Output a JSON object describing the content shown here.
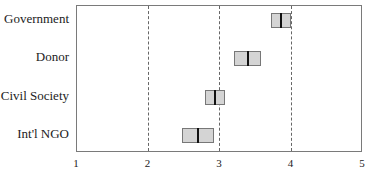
{
  "chart_data": {
    "type": "boxplot",
    "orientation": "horizontal",
    "title": "",
    "xlabel": "",
    "ylabel": "",
    "xlim": [
      1,
      5
    ],
    "x_ticks": [
      "1",
      "2",
      "3",
      "4",
      "5"
    ],
    "grid": {
      "vertical_dashed_at": [
        2,
        3,
        4
      ]
    },
    "categories": [
      "Government",
      "Donor",
      "Civil Society",
      "Int'l NGO"
    ],
    "series": [
      {
        "name": "Government",
        "q1": 3.72,
        "median": 3.86,
        "q3": 4.0
      },
      {
        "name": "Donor",
        "q1": 3.19,
        "median": 3.39,
        "q3": 3.58
      },
      {
        "name": "Civil Society",
        "q1": 2.79,
        "median": 2.93,
        "q3": 3.07
      },
      {
        "name": "Int'l NGO",
        "q1": 2.47,
        "median": 2.69,
        "q3": 2.92
      }
    ],
    "colors": {
      "box_fill": "#d4d4d4",
      "box_edge": "#777777",
      "median": "#111111",
      "grid": "#666666"
    }
  }
}
